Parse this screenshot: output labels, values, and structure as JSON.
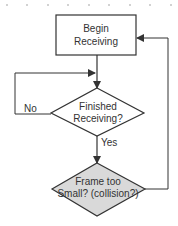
{
  "diagram": {
    "type": "flowchart",
    "nodes": [
      {
        "id": "begin",
        "shape": "rectangle",
        "lines": [
          "Begin",
          "Receiving"
        ],
        "fill": "#ffffff"
      },
      {
        "id": "finished",
        "shape": "diamond",
        "lines": [
          "Finished",
          "Receiving?"
        ],
        "fill": "#ffffff"
      },
      {
        "id": "frame",
        "shape": "diamond",
        "lines": [
          "Frame too",
          "Small? (collision?)"
        ],
        "fill": "#d9d9d9"
      }
    ],
    "edges": [
      {
        "from": "begin",
        "to": "finished",
        "label": ""
      },
      {
        "from": "finished",
        "to": "finished",
        "label": "No"
      },
      {
        "from": "finished",
        "to": "frame",
        "label": "Yes"
      },
      {
        "from": "frame",
        "to": "begin",
        "label": ""
      }
    ],
    "labels": {
      "no": "No",
      "yes": "Yes"
    },
    "colors": {
      "stroke": "#333333",
      "highlight_fill": "#d9d9d9",
      "grid_dot": "#999999"
    }
  }
}
